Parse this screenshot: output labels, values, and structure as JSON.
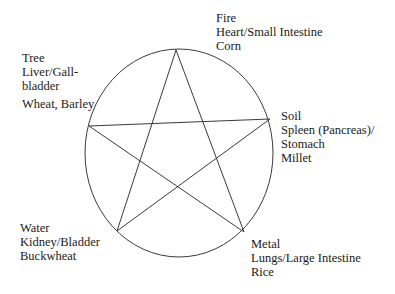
{
  "diagram": {
    "type": "five-elements-pentagram",
    "stroke_color": "#3a3a3a",
    "circle": {
      "cx": 179,
      "cy": 153,
      "rx": 94,
      "ry": 104
    },
    "vertices": {
      "fire": {
        "x": 176,
        "y": 50
      },
      "soil": {
        "x": 270,
        "y": 119
      },
      "metal": {
        "x": 244,
        "y": 232
      },
      "water": {
        "x": 117,
        "y": 231
      },
      "tree": {
        "x": 89,
        "y": 126
      }
    },
    "star_order": [
      "fire",
      "metal",
      "tree",
      "soil",
      "water",
      "fire"
    ]
  },
  "elements": {
    "fire": {
      "name": "Fire",
      "organs": "Heart/Small Intestine",
      "grain": "Corn"
    },
    "tree": {
      "name": "Tree",
      "organs_line1": "Liver/Gall-",
      "organs_line2": "bladder",
      "grain": "Wheat, Barley"
    },
    "soil": {
      "name": "Soil",
      "organs_line1": "Spleen (Pancreas)/",
      "organs_line2": "Stomach",
      "grain": "Millet"
    },
    "water": {
      "name": "Water",
      "organs": "Kidney/Bladder",
      "grain": "Buckwheat"
    },
    "metal": {
      "name": "Metal",
      "organs": "Lungs/Large Intestine",
      "grain": "Rice"
    }
  }
}
